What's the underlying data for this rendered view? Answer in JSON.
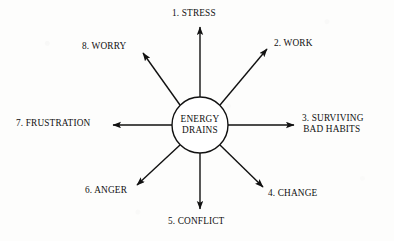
{
  "diagram": {
    "type": "radial-spoke",
    "hub": {
      "name": "energy-drains-hub",
      "line1": "ENERGY",
      "line2": "DRAINS",
      "center_x": 200,
      "center_y": 125,
      "radius": 28,
      "stroke": "#111111",
      "fill": "#ffffff"
    },
    "style": {
      "background": "#ffffff",
      "ink": "#111111",
      "line_width": 1.4
    },
    "spokes": [
      {
        "id": 1,
        "number": "1.",
        "label": "1. STRESS",
        "text": "STRESS",
        "direction": "up",
        "angle_deg": 270,
        "tip_x": 200,
        "tip_y": 24,
        "label_x": 172,
        "label_y": 8
      },
      {
        "id": 2,
        "number": "2.",
        "label": "2. WORK",
        "text": "WORK",
        "direction": "up-right",
        "angle_deg": 315,
        "tip_x": 270,
        "tip_y": 46,
        "label_x": 274,
        "label_y": 38
      },
      {
        "id": 3,
        "number": "3.",
        "label": "3. SURVIVING BAD HABITS",
        "text": "SURVIVING",
        "text_line2": "BAD HABITS",
        "direction": "right",
        "angle_deg": 0,
        "tip_x": 297,
        "tip_y": 125,
        "label_x": 302,
        "label_y": 113
      },
      {
        "id": 4,
        "number": "4.",
        "label": "4. CHANGE",
        "text": "CHANGE",
        "direction": "down-right",
        "angle_deg": 45,
        "tip_x": 266,
        "tip_y": 190,
        "label_x": 268,
        "label_y": 188
      },
      {
        "id": 5,
        "number": "5.",
        "label": "5. CONFLICT",
        "text": "CONFLICT",
        "direction": "down",
        "angle_deg": 90,
        "tip_x": 200,
        "tip_y": 212,
        "label_x": 168,
        "label_y": 216
      },
      {
        "id": 6,
        "number": "6.",
        "label": "6. ANGER",
        "text": "ANGER",
        "direction": "down-left",
        "angle_deg": 135,
        "tip_x": 134,
        "tip_y": 188,
        "label_x": 85,
        "label_y": 185
      },
      {
        "id": 7,
        "number": "7.",
        "label": "7. FRUSTRATION",
        "text": "FRUSTRATION",
        "direction": "left",
        "angle_deg": 180,
        "tip_x": 110,
        "tip_y": 125,
        "label_x": 16,
        "label_y": 118
      },
      {
        "id": 8,
        "number": "8.",
        "label": "8. WORRY",
        "text": "WORRY",
        "direction": "up-left",
        "angle_deg": 225,
        "tip_x": 140,
        "tip_y": 50,
        "label_x": 82,
        "label_y": 41
      }
    ]
  }
}
